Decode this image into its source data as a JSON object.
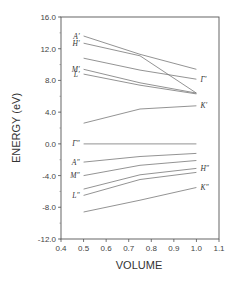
{
  "chart_data": {
    "type": "line",
    "title": "",
    "xlabel": "VOLUME",
    "ylabel": "ENERGY (eV)",
    "xlim": [
      0.4,
      1.1
    ],
    "ylim": [
      -12.0,
      16.0
    ],
    "xticks": [
      "0.4",
      "0.5",
      "0.6",
      "0.7",
      "0.8",
      "0.9",
      "1.0",
      "1.1"
    ],
    "yticks": [
      "16.0",
      "12.0",
      "8.0",
      "4.0",
      "0.0",
      "-4.0",
      "-8.0",
      "-12.0"
    ],
    "grid": false,
    "legend": "inline labels",
    "x": [
      0.5,
      0.75,
      1.0
    ],
    "series": [
      {
        "name": "A'",
        "label_side": "left",
        "values": [
          13.6,
          11.3,
          9.4
        ]
      },
      {
        "name": "H'",
        "label_side": "left",
        "values": [
          12.7,
          11.1,
          6.4
        ]
      },
      {
        "name": "Γ'",
        "label_side": "right",
        "values": [
          10.8,
          9.3,
          8.15
        ]
      },
      {
        "name": "M'",
        "label_side": "left",
        "values": [
          9.4,
          7.7,
          6.4
        ]
      },
      {
        "name": "L'",
        "label_side": "left",
        "values": [
          8.8,
          7.4,
          6.3
        ]
      },
      {
        "name": "K'",
        "label_side": "right",
        "values": [
          2.6,
          4.4,
          4.8
        ]
      },
      {
        "name": "Γ''",
        "label_side": "left",
        "values": [
          0.0,
          0.0,
          0.0
        ]
      },
      {
        "name": "A''",
        "label_side": "left",
        "values": [
          -2.3,
          -1.6,
          -1.2
        ]
      },
      {
        "name": "M''",
        "label_side": "left",
        "values": [
          -4.0,
          -2.7,
          -2.1
        ]
      },
      {
        "name": "H''",
        "label_side": "right",
        "values": [
          -5.7,
          -3.9,
          -3.1
        ]
      },
      {
        "name": "L''",
        "label_side": "left",
        "values": [
          -6.5,
          -4.5,
          -3.6
        ]
      },
      {
        "name": "K''",
        "label_side": "right",
        "values": [
          -8.6,
          -7.1,
          -5.5
        ]
      }
    ],
    "labels": {
      "A'": "A′",
      "H'": "H′",
      "Γ'": "Γ′",
      "M'": "M′",
      "L'": "L′",
      "K'": "K′",
      "Γ''": "Γ″",
      "A''": "A″",
      "M''": "M″",
      "H''": "H″",
      "L''": "L″",
      "K''": "K″"
    }
  }
}
